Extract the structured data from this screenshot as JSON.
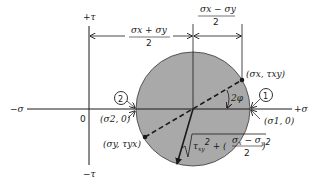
{
  "diagram": {
    "colors": {
      "circle_fill": "#a9a9a9",
      "ink": "#1a1a1a",
      "background": "#ffffff"
    },
    "axes": {
      "tau_positive": "+τ",
      "tau_negative": "−τ",
      "sigma_positive": "+σ",
      "sigma_negative": "−σ",
      "origin": "0"
    },
    "dimensions": {
      "center_offset": {
        "numerator": "σx + σy",
        "denominator": "2"
      },
      "half_difference": {
        "numerator": "σx − σy",
        "denominator": "2"
      }
    },
    "points": {
      "x_face": {
        "label": "(σx, τxy)"
      },
      "y_face": {
        "label": "(σy, τyx)"
      },
      "principal_1": {
        "label": "(σ1, 0)",
        "marker": "1"
      },
      "principal_2": {
        "label": "(σ2, 0)",
        "marker": "2"
      }
    },
    "angle": {
      "label": "2φ"
    },
    "radius": {
      "formula": "√(τxy² + ((σx − σy)/2)²)"
    }
  }
}
